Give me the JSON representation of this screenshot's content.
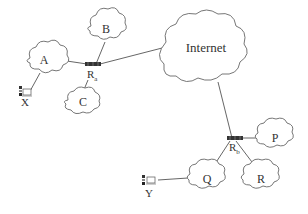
{
  "diagram": {
    "type": "network-topology",
    "clouds": [
      {
        "id": "A",
        "label": "A"
      },
      {
        "id": "B",
        "label": "B"
      },
      {
        "id": "C",
        "label": "C"
      },
      {
        "id": "Internet",
        "label": "Internet"
      },
      {
        "id": "P",
        "label": "P"
      },
      {
        "id": "Q",
        "label": "Q"
      },
      {
        "id": "R",
        "label": "R"
      }
    ],
    "routers": [
      {
        "id": "Ra",
        "label": "R",
        "subscript": "a"
      },
      {
        "id": "Rb",
        "label": "R",
        "subscript": "b"
      }
    ],
    "hosts": [
      {
        "id": "X",
        "label": "X"
      },
      {
        "id": "Y",
        "label": "Y"
      }
    ],
    "links": [
      [
        "X",
        "A"
      ],
      [
        "A",
        "Ra"
      ],
      [
        "B",
        "Ra"
      ],
      [
        "C",
        "Ra"
      ],
      [
        "Ra",
        "Internet"
      ],
      [
        "Internet",
        "Rb"
      ],
      [
        "Rb",
        "P"
      ],
      [
        "Rb",
        "Q"
      ],
      [
        "Rb",
        "R"
      ],
      [
        "Y",
        "Q"
      ]
    ]
  }
}
